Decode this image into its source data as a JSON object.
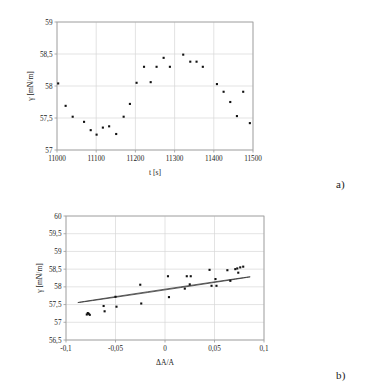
{
  "figure": {
    "panel_a_tag": "a)",
    "panel_b_tag": "b)"
  },
  "chart_data": [
    {
      "id": "panel_a",
      "type": "scatter",
      "title": "",
      "xlabel": "t [s]",
      "ylabel": "γ [mN/m]",
      "xlim": [
        11000,
        11500
      ],
      "ylim": [
        57,
        59
      ],
      "xticks": [
        11000,
        11100,
        11200,
        11300,
        11400,
        11500
      ],
      "xtick_labels": [
        "11000",
        "11100",
        "11200",
        "11300",
        "11400",
        "11500"
      ],
      "yticks": [
        57,
        57.5,
        58,
        58.5,
        59
      ],
      "ytick_labels": [
        "57",
        "57,5",
        "58",
        "58,5",
        "59"
      ],
      "grid": true,
      "legend": "none",
      "marker": "square",
      "x": [
        11003,
        11022,
        11040,
        11069,
        11086,
        11101,
        11117,
        11133,
        11151,
        11170,
        11186,
        11203,
        11222,
        11239,
        11254,
        11272,
        11288,
        11322,
        11340,
        11356,
        11372,
        11408,
        11425,
        11442,
        11459,
        11475,
        11492
      ],
      "y": [
        58.04,
        57.69,
        57.52,
        57.44,
        57.31,
        57.24,
        57.35,
        57.37,
        57.25,
        57.52,
        57.72,
        58.05,
        58.3,
        58.06,
        58.3,
        58.44,
        58.3,
        58.49,
        58.38,
        58.38,
        58.3,
        58.03,
        57.91,
        57.75,
        57.53,
        57.91,
        57.42
      ]
    },
    {
      "id": "panel_b",
      "type": "scatter",
      "title": "",
      "xlabel": "ΔA/A",
      "ylabel": "γ [mN/m]",
      "xlim": [
        -0.1,
        0.1
      ],
      "ylim": [
        56.5,
        60
      ],
      "xticks": [
        -0.1,
        -0.05,
        0,
        0.05,
        0.1
      ],
      "xtick_labels": [
        "-0,1",
        "-0,05",
        "0",
        "0,05",
        "0,1"
      ],
      "yticks": [
        56.5,
        57,
        57.5,
        58,
        58.5,
        59,
        59.5,
        60
      ],
      "ytick_labels": [
        "56,5",
        "57",
        "57,5",
        "58",
        "58,5",
        "59",
        "59,5",
        "60"
      ],
      "grid": true,
      "legend": "none",
      "marker": "square",
      "x": [
        -0.079,
        -0.078,
        -0.077,
        -0.076,
        -0.062,
        -0.061,
        -0.05,
        -0.049,
        -0.025,
        -0.024,
        0.003,
        0.004,
        0.02,
        0.022,
        0.025,
        0.026,
        0.045,
        0.047,
        0.051,
        0.052,
        0.063,
        0.066,
        0.071,
        0.073,
        0.074,
        0.076,
        0.079
      ],
      "y": [
        57.22,
        57.26,
        57.24,
        57.21,
        57.46,
        57.31,
        57.72,
        57.44,
        58.06,
        57.53,
        58.3,
        57.71,
        57.95,
        58.3,
        58.07,
        58.3,
        58.48,
        58.03,
        58.22,
        58.03,
        58.47,
        58.17,
        58.5,
        58.52,
        58.4,
        58.55,
        58.57
      ],
      "annotations": [
        {
          "type": "ellipse",
          "label": "hysteresis-loop-fit",
          "center_x": -0.001,
          "center_y": 57.92,
          "semi_major": 0.088,
          "semi_minor": 0.0105,
          "rotation_deg": -8.5
        }
      ]
    }
  ]
}
